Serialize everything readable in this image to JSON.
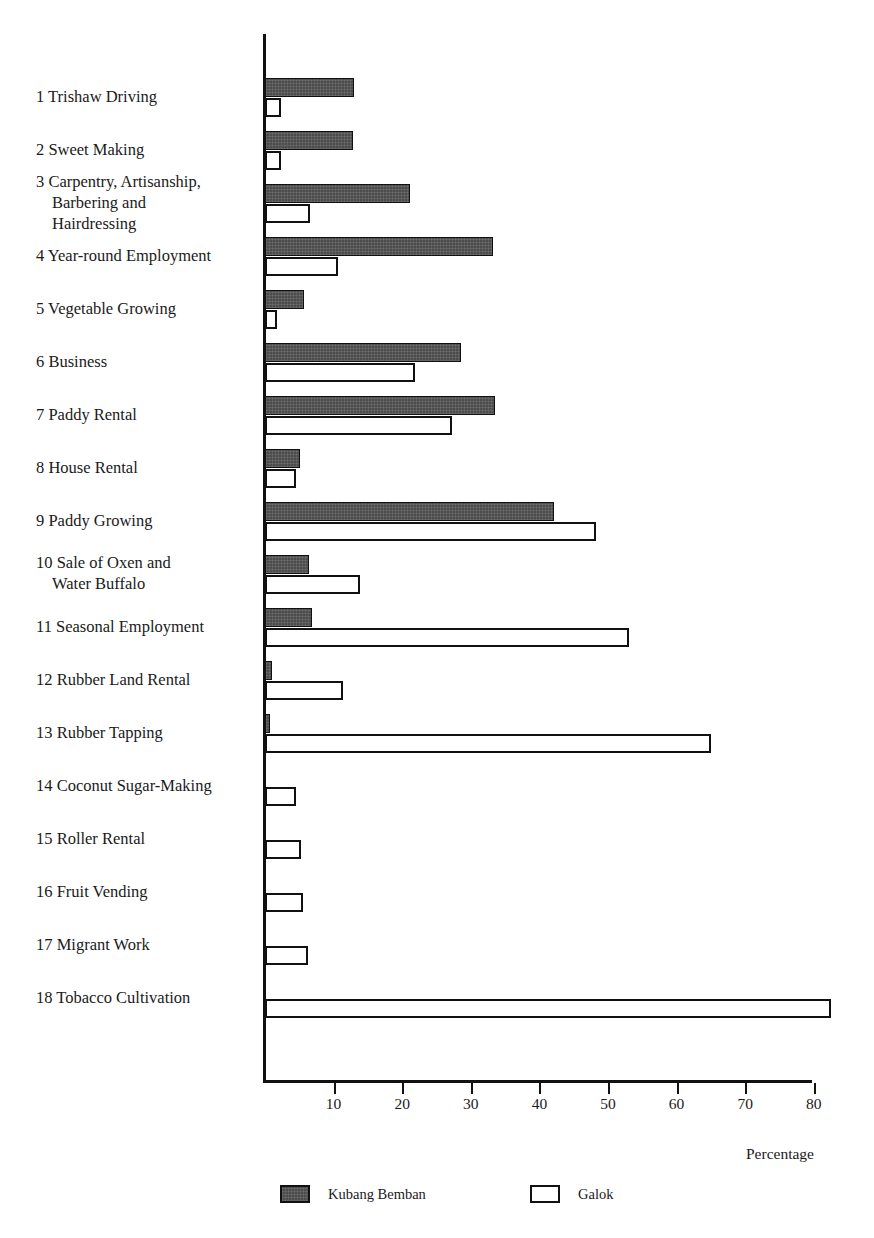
{
  "chart_data": {
    "type": "bar",
    "orientation": "horizontal",
    "title": "",
    "xlabel": "Percentage",
    "ylabel": "",
    "xlim": [
      0,
      84
    ],
    "xticks": [
      10,
      20,
      30,
      40,
      50,
      60,
      70,
      80
    ],
    "grid": false,
    "legend_position": "bottom",
    "categories": [
      "1 Trishaw Driving",
      "2 Sweet Making",
      "3 Carpentry, Artisanship, Barbering and Hairdressing",
      "4 Year-round Employment",
      "5 Vegetable Growing",
      "6 Business",
      "7 Paddy Rental",
      "8 House Rental",
      "9 Paddy Growing",
      "10 Sale of Oxen and Water Buffalo",
      "11 Seasonal Employment",
      "12 Rubber Land Rental",
      "13 Rubber Tapping",
      "14 Coconut Sugar-Making",
      "15 Roller Rental",
      "16 Fruit Vending",
      "17 Migrant Work",
      "18 Tobacco Cultivation"
    ],
    "series": [
      {
        "name": "Kubang Bemban",
        "color": "#4c4c4c",
        "values": [
          13.0,
          12.8,
          21.2,
          33.2,
          5.7,
          28.6,
          33.5,
          5.1,
          42.2,
          6.4,
          6.8,
          1.0,
          0.8,
          0,
          0,
          0,
          0,
          0
        ]
      },
      {
        "name": "Galok",
        "color": "#ffffff",
        "values": [
          2.4,
          2.4,
          6.5,
          10.6,
          1.8,
          21.9,
          27.2,
          4.5,
          48.3,
          13.8,
          53.0,
          11.4,
          65.0,
          4.5,
          5.3,
          5.5,
          6.3,
          82.5
        ]
      }
    ]
  },
  "categories_display": [
    {
      "number": "1",
      "lines": [
        "Trishaw Driving"
      ]
    },
    {
      "number": "2",
      "lines": [
        "Sweet Making"
      ]
    },
    {
      "number": "3",
      "lines": [
        "Carpentry, Artisanship,",
        "Barbering and",
        "Hairdressing"
      ]
    },
    {
      "number": "4",
      "lines": [
        "Year-round Employment"
      ]
    },
    {
      "number": "5",
      "lines": [
        "Vegetable Growing"
      ]
    },
    {
      "number": "6",
      "lines": [
        "Business"
      ]
    },
    {
      "number": "7",
      "lines": [
        "Paddy Rental"
      ]
    },
    {
      "number": "8",
      "lines": [
        "House Rental"
      ]
    },
    {
      "number": "9",
      "lines": [
        "Paddy Growing"
      ]
    },
    {
      "number": "10",
      "lines": [
        "Sale of Oxen and",
        "Water Buffalo"
      ]
    },
    {
      "number": "11",
      "lines": [
        "Seasonal Employment"
      ]
    },
    {
      "number": "12",
      "lines": [
        "Rubber Land Rental"
      ]
    },
    {
      "number": "13",
      "lines": [
        "Rubber Tapping"
      ]
    },
    {
      "number": "14",
      "lines": [
        "Coconut Sugar-Making"
      ]
    },
    {
      "number": "15",
      "lines": [
        "Roller Rental"
      ]
    },
    {
      "number": "16",
      "lines": [
        "Fruit Vending"
      ]
    },
    {
      "number": "17",
      "lines": [
        "Migrant Work"
      ]
    },
    {
      "number": "18",
      "lines": [
        "Tobacco Cultivation"
      ]
    }
  ],
  "axis": {
    "x_caption": "Percentage",
    "tick_labels": [
      "10",
      "20",
      "30",
      "40",
      "50",
      "60",
      "70",
      "80"
    ]
  },
  "legend": {
    "items": [
      {
        "label": "Kubang Bemban",
        "swatch": "dark"
      },
      {
        "label": "Galok",
        "swatch": "light"
      }
    ]
  }
}
